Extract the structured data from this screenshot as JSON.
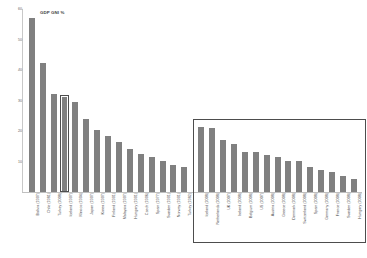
{
  "chart_data": {
    "type": "bar",
    "title": "GDP GNI %",
    "xlabel": "",
    "ylabel": "",
    "ylim": [
      0,
      60
    ],
    "yticks": [
      60,
      50,
      40,
      30,
      20,
      10
    ],
    "grid": false,
    "legend": null,
    "bar_color": "#808080",
    "categories": [
      "Bolivia (1997)",
      "Chile (1981)",
      "Turkey (2008)",
      "Iceland (1997)",
      "Mexico (1994)",
      "Japan (1997)",
      "Korea (1997)",
      "Finland (1991)",
      "Malaysia (1997)",
      "Hungary (1991)",
      "Czech (1996)",
      "Spain (1977)",
      "Sweden (1991)",
      "Norway (1991)",
      "Turkey (1982)",
      "Iceland (2008)",
      "Netherlands (2008)",
      "UK (2007)",
      "Ireland (2008)",
      "Belgium (2008)",
      "US (2007)",
      "Austria (2008)",
      "Greece (2008)",
      "Denmark (2008)",
      "Switzerland (2008)",
      "Spain (2008)",
      "Germany (2008)",
      "France (2008)",
      "Sweden (2008)",
      "Hungary (2008)"
    ],
    "values": [
      57.0,
      42.2,
      32.0,
      31.3,
      29.5,
      24.0,
      20.2,
      18.5,
      16.4,
      14.0,
      12.5,
      11.5,
      10.3,
      9.0,
      8.2,
      21.3,
      21.0,
      17.0,
      15.8,
      13.0,
      13.0,
      12.0,
      11.5,
      10.3,
      10.2,
      8.3,
      7.2,
      6.4,
      5.4,
      4.2
    ],
    "annotations": {
      "highlight_bar_label": "Iceland (1997)",
      "inset_group_label": "2007-2008 crisis episodes",
      "inset_group_start_index": 15,
      "inset_group_end_index": 29
    }
  }
}
